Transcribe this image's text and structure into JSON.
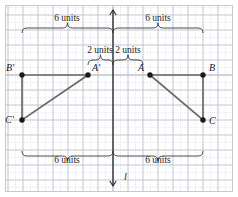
{
  "figure": {
    "type": "geometry-reflection-diagram",
    "background_color": "#ffffff",
    "border_color": "#c9c9c9",
    "grid": {
      "major_color": "#b9bfcb",
      "minor_color": "#d8dce4",
      "major_spacing_px": 15,
      "minor_spacing_px": 7.5,
      "origin_x_px": 113,
      "baseline_y_px": 75
    },
    "mirror_line": {
      "name": "l",
      "label": "l",
      "color": "#2b2b2b",
      "orientation": "vertical",
      "x_px": 113,
      "top_px": 10,
      "bottom_px": 186,
      "arrow_top": true,
      "arrow_bottom": true
    },
    "shape_color": "#6b6b6b",
    "point_color": "#1a1a1a",
    "points": [
      {
        "label": "A",
        "x_px": 150,
        "y_px": 75,
        "label_dx": -12,
        "label_dy": -4
      },
      {
        "label": "B",
        "x_px": 203,
        "y_px": 75,
        "label_dx": 6,
        "label_dy": -4
      },
      {
        "label": "C",
        "x_px": 203,
        "y_px": 120,
        "label_dx": 6,
        "label_dy": 4
      },
      {
        "label": "A'",
        "x_px": 88,
        "y_px": 75,
        "label_dx": 4,
        "label_dy": -4
      },
      {
        "label": "B'",
        "x_px": 22,
        "y_px": 75,
        "label_dx": -16,
        "label_dy": -4
      },
      {
        "label": "C'",
        "x_px": 22,
        "y_px": 120,
        "label_dx": -17,
        "label_dy": 3
      }
    ],
    "triangles": [
      {
        "name": "triangle-ABC",
        "vertices": "A,B,C"
      },
      {
        "name": "triangle-A'B'C'",
        "vertices": "A',B',C'"
      }
    ],
    "measurements": [
      {
        "id": "top-left-brace",
        "label": "6 units",
        "from_px": 22,
        "to_px": 113,
        "label_x_px": 67,
        "label_y_px": 21,
        "direction": "up"
      },
      {
        "id": "top-right-brace",
        "label": "6 units",
        "from_px": 113,
        "to_px": 203,
        "label_x_px": 158,
        "label_y_px": 21,
        "direction": "up"
      },
      {
        "id": "inner-left-brace",
        "label": "2 units",
        "from_px": 88,
        "to_px": 113,
        "label_x_px": 100,
        "label_y_px": 53,
        "direction": "up"
      },
      {
        "id": "inner-right-brace",
        "label": "2 units",
        "from_px": 113,
        "to_px": 143,
        "label_x_px": 128,
        "label_y_px": 53,
        "direction": "up"
      },
      {
        "id": "bottom-left-brace",
        "label": "6 units",
        "from_px": 22,
        "to_px": 113,
        "label_x_px": 67,
        "label_y_px": 163,
        "direction": "down"
      },
      {
        "id": "bottom-right-brace",
        "label": "6 units",
        "from_px": 113,
        "to_px": 203,
        "label_x_px": 158,
        "label_y_px": 163,
        "direction": "down"
      }
    ]
  }
}
